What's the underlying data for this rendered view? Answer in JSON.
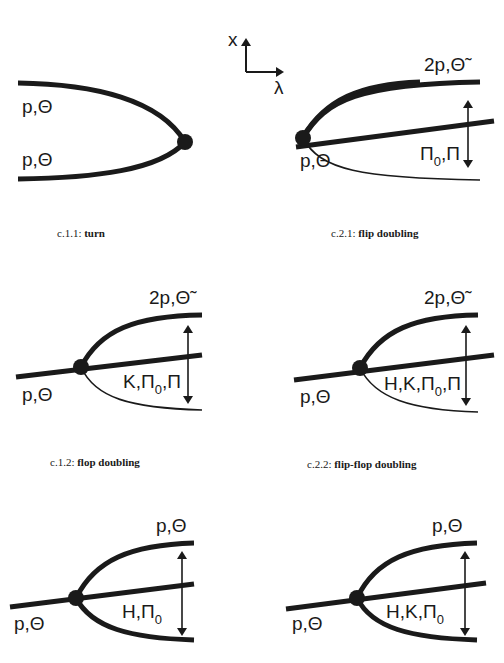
{
  "axes": {
    "vertical_label": "x",
    "horizontal_label": "λ"
  },
  "panels": [
    {
      "id": "c.1.1",
      "caption_code": "c.1.1:",
      "caption_name": "turn",
      "branch_labels": [
        "p,Θ",
        "p,Θ"
      ]
    },
    {
      "id": "c.2.1",
      "caption_code": "c.2.1:",
      "caption_name": "flip doubling",
      "upper_label": "2p,Θ̃",
      "incoming_label": "p,Θ",
      "arrow_label_pre": "Π",
      "arrow_label_sub": "0",
      "arrow_label_post": ",Π"
    },
    {
      "id": "c.1.2",
      "caption_code": "c.1.2:",
      "caption_name": "flop doubling",
      "upper_label": "2p,Θ̃",
      "incoming_label": "p,Θ",
      "arrow_label_pre": "K,Π",
      "arrow_label_sub": "0",
      "arrow_label_post": ",Π"
    },
    {
      "id": "c.2.2",
      "caption_code": "c.2.2:",
      "caption_name": "flip-flop doubling",
      "upper_label": "2p,Θ̃",
      "incoming_label": "p,Θ",
      "arrow_label_pre": "H,K,Π",
      "arrow_label_sub": "0",
      "arrow_label_post": ",Π"
    },
    {
      "id": "c.1.3",
      "upper_label": "p,Θ",
      "incoming_label": "p,Θ",
      "arrow_label_pre": "H,Π",
      "arrow_label_sub": "0",
      "arrow_label_post": ""
    },
    {
      "id": "c.2.3",
      "upper_label": "p,Θ",
      "incoming_label": "p,Θ",
      "arrow_label_pre": "H,K,Π",
      "arrow_label_sub": "0",
      "arrow_label_post": ""
    }
  ],
  "colors": {
    "ink": "#1a1a1a",
    "background": "#ffffff"
  }
}
